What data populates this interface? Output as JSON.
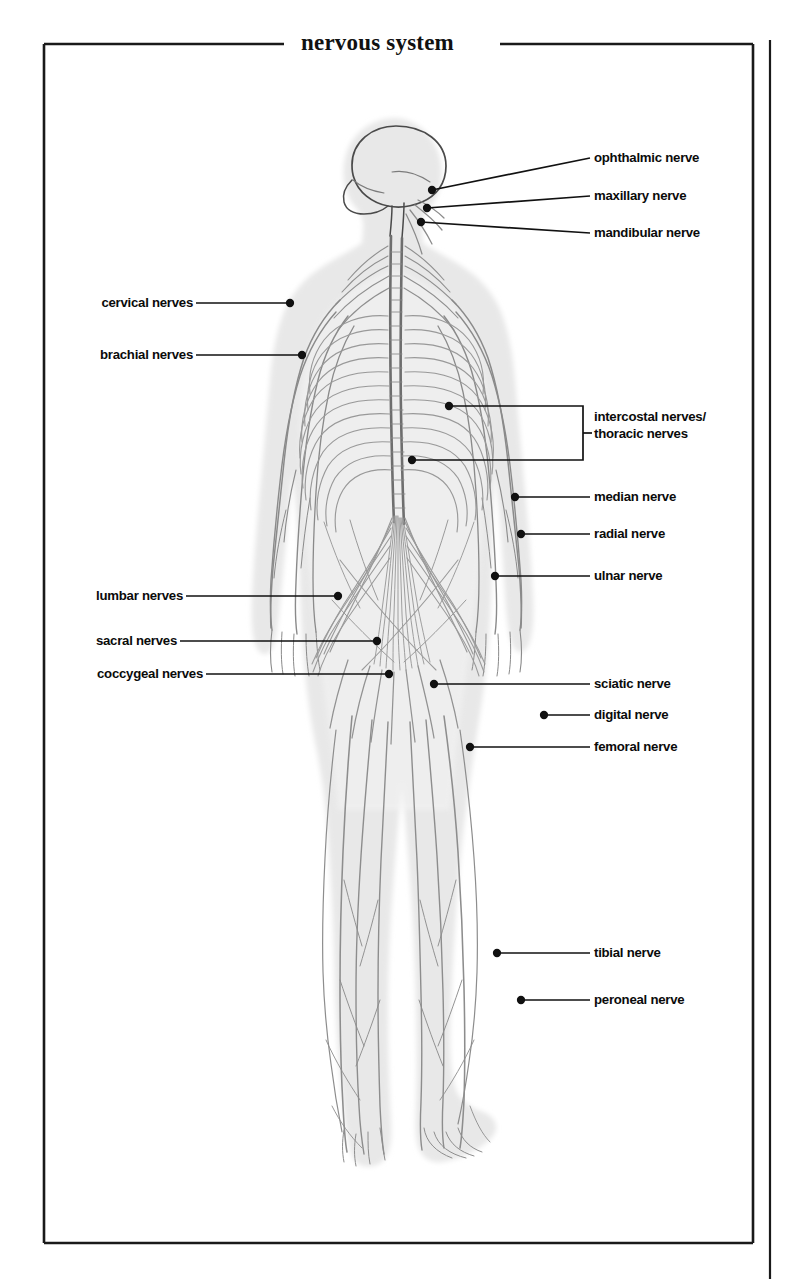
{
  "title": "nervous system",
  "figure": {
    "body_fill": "#e9e9e9",
    "nerve_stroke": "#8c8c8c",
    "outline_stroke": "#555555",
    "label_color": "#0b0b0b",
    "frame_color": "#1a1a1a"
  },
  "labels_right": [
    {
      "id": "ophthalmic-nerve",
      "text": "ophthalmic nerve"
    },
    {
      "id": "maxillary-nerve",
      "text": "maxillary nerve"
    },
    {
      "id": "mandibular-nerve",
      "text": "mandibular nerve"
    },
    {
      "id": "median-nerve",
      "text": "median nerve"
    },
    {
      "id": "radial-nerve",
      "text": "radial nerve"
    },
    {
      "id": "ulnar-nerve",
      "text": "ulnar nerve"
    },
    {
      "id": "sciatic-nerve",
      "text": "sciatic nerve"
    },
    {
      "id": "digital-nerve",
      "text": "digital nerve"
    },
    {
      "id": "femoral-nerve",
      "text": "femoral nerve"
    },
    {
      "id": "tibial-nerve",
      "text": "tibial nerve"
    },
    {
      "id": "peroneal-nerve",
      "text": "peroneal nerve"
    }
  ],
  "labels_left": [
    {
      "id": "cervical-nerves",
      "text": "cervical nerves"
    },
    {
      "id": "brachial-nerves",
      "text": "brachial nerves"
    },
    {
      "id": "lumbar-nerves",
      "text": "lumbar nerves"
    },
    {
      "id": "sacral-nerves",
      "text": "sacral nerves"
    },
    {
      "id": "coccygeal-nerves",
      "text": "coccygeal nerves"
    }
  ],
  "labels_bracket": [
    {
      "id": "intercostal-thoracic-nerves",
      "line1": "intercostal nerves/",
      "line2": "thoracic nerves"
    }
  ]
}
